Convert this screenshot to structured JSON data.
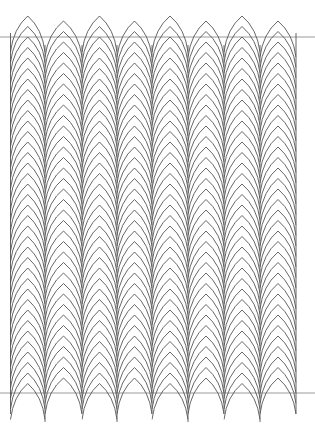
{
  "pattern": {
    "name": "Gothic arch herringbone line pattern",
    "stroke_color": "#555555",
    "guide_color": "#9a9a9a",
    "background": "#ffffff",
    "column_edges": [
      10.5,
      45,
      82,
      117,
      152,
      188,
      224,
      260,
      296
    ],
    "columns": 8,
    "arch_pitch": 10.5,
    "arch_height": 36,
    "top_first_peak_y": 16,
    "column_offsets": [
      0,
      5,
      0,
      5,
      0,
      5,
      0,
      5
    ],
    "bottom_limit_y": 422,
    "edge_lines_top_y": 33,
    "edge_lines_bottom_y": 414,
    "guide_lines_y": [
      37,
      393
    ]
  }
}
